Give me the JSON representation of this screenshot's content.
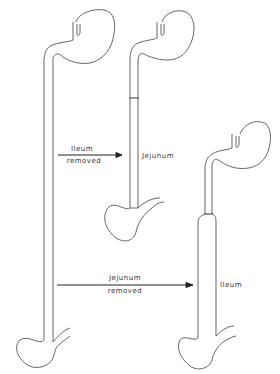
{
  "diagram": {
    "type": "anatomical-schematic",
    "panels": [
      {
        "id": "intact",
        "description": "Intact stomach and full small intestine"
      },
      {
        "id": "ileum-removed",
        "description": "After ileum removal; remaining jejunum"
      },
      {
        "id": "jejunum-removed",
        "description": "After jejunum removal; remaining ileum (dilated)"
      }
    ],
    "labels": {
      "arrow1_line1": "Ileum",
      "arrow1_line2": "removed",
      "jejunum_label": "Jejunum",
      "arrow2_line1": "Jejunum",
      "arrow2_line2": "removed",
      "ileum_label": "Ileum"
    },
    "colors": {
      "stroke": "#555555",
      "arrow": "#222222",
      "background": "#ffffff"
    }
  }
}
